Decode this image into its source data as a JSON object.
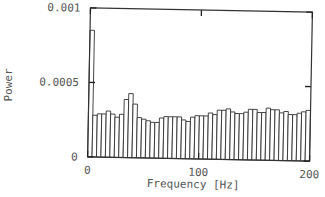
{
  "chart_data": {
    "type": "bar",
    "title": "",
    "xlabel": "Frequency [Hz]",
    "ylabel": "Power",
    "xlim": [
      0,
      200
    ],
    "ylim": [
      0,
      0.001
    ],
    "x_ticks": [
      0,
      100,
      200
    ],
    "x_tick_labels": [
      "0",
      "100",
      "200"
    ],
    "y_ticks": [
      0,
      0.0005,
      0.001
    ],
    "y_tick_labels": [
      "0",
      "0.0005",
      "0.001"
    ],
    "grid": false,
    "legend": null,
    "bin_width": 4,
    "x": [
      2,
      6,
      10,
      14,
      18,
      22,
      26,
      30,
      34,
      38,
      42,
      46,
      50,
      54,
      58,
      62,
      66,
      70,
      74,
      78,
      82,
      86,
      90,
      94,
      98,
      102,
      106,
      110,
      114,
      118,
      122,
      126,
      130,
      134,
      138,
      142,
      146,
      150,
      154,
      158,
      162,
      166,
      170,
      174,
      178,
      182,
      186,
      190,
      194,
      198
    ],
    "values": [
      0.00085,
      0.00028,
      0.00029,
      0.00029,
      0.00031,
      0.00029,
      0.00027,
      0.00029,
      0.00039,
      0.00043,
      0.00036,
      0.00027,
      0.00026,
      0.00025,
      0.00024,
      0.00024,
      0.00027,
      0.00028,
      0.00028,
      0.00028,
      0.00028,
      0.00026,
      0.00025,
      0.00028,
      0.00029,
      0.00029,
      0.00029,
      0.00031,
      0.0003,
      0.00033,
      0.00033,
      0.00034,
      0.00032,
      0.00031,
      0.00031,
      0.00032,
      0.00034,
      0.00034,
      0.00032,
      0.00032,
      0.00035,
      0.00034,
      0.00034,
      0.00032,
      0.00033,
      0.00031,
      0.00031,
      0.00032,
      0.00033,
      0.00034
    ]
  }
}
